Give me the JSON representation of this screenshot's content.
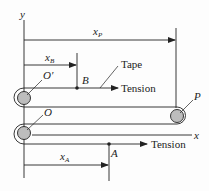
{
  "diagram": {
    "axes": {
      "x_label": "x",
      "y_label": "y"
    },
    "dimensions": {
      "x_P": {
        "main": "x",
        "sub": "P"
      },
      "x_B": {
        "main": "x",
        "sub": "B"
      },
      "x_A": {
        "main": "x",
        "sub": "A"
      }
    },
    "points": {
      "O_prime": "O′",
      "O": "O",
      "P": "P",
      "B": "B",
      "A": "A"
    },
    "labels": {
      "tape": "Tape",
      "tension_top": "Tension",
      "tension_bottom": "Tension"
    },
    "colors": {
      "line": "#222222",
      "pulley_fill": "#bdbdbd",
      "background": "#fdfdfd"
    }
  }
}
